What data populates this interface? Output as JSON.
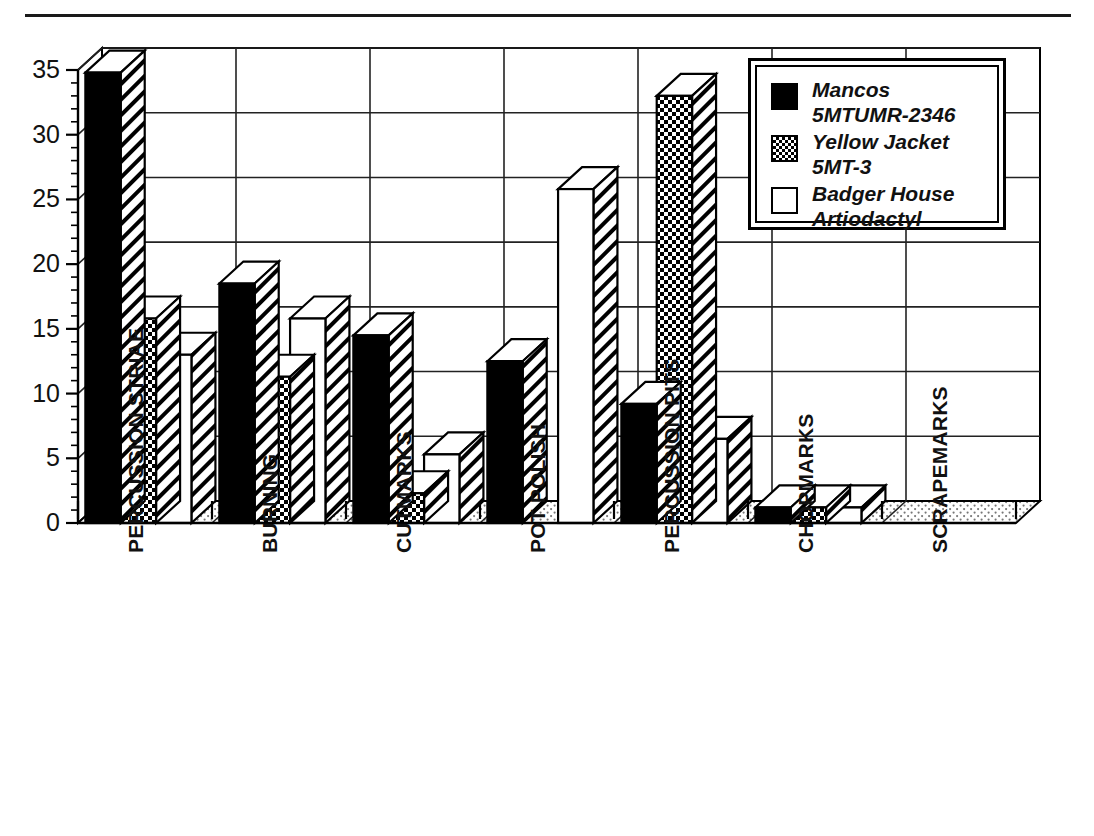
{
  "chart_data": {
    "type": "bar",
    "title": "",
    "subtitle": "",
    "xlabel": "",
    "ylabel": "",
    "ylim": [
      0,
      35
    ],
    "ytick_step": 5,
    "yticks": [
      0,
      5,
      10,
      15,
      20,
      25,
      30,
      35
    ],
    "grid": true,
    "grid_orientation": "both",
    "legend_position": "top-right",
    "style": "3d-grouped-bars",
    "categories": [
      "PERCUSSION STRIAE",
      "BURNING",
      "CUTMARKS",
      "POT POLISH",
      "PERCUSSION PITS",
      "CHOPMARKS",
      "SCRAPEMARKS"
    ],
    "series": [
      {
        "name": "Mancos 5MTUMR-2346",
        "fill": "solid-black",
        "color": "#000000",
        "values": [
          34.8,
          18.5,
          14.5,
          12.5,
          9.2,
          1.2,
          0
        ]
      },
      {
        "name": "Yellow Jacket 5MT-3",
        "fill": "dotted-checker",
        "color": "#000000",
        "values": [
          15.8,
          11.3,
          2.3,
          0,
          33.0,
          1.2,
          0
        ]
      },
      {
        "name": "Badger House Artiodactyl",
        "fill": "white",
        "color": "#ffffff",
        "values": [
          13.0,
          15.8,
          5.3,
          25.8,
          6.5,
          1.2,
          0
        ]
      }
    ]
  },
  "legend": {
    "items": [
      {
        "label": "Mancos 5MTUMR-2346",
        "swatch": "solid-black"
      },
      {
        "label": "Yellow Jacket 5MT-3",
        "swatch": "dotted-checker"
      },
      {
        "label": "Badger House Artiodactyl",
        "swatch": "white"
      }
    ]
  },
  "axis": {
    "y_tick_labels": [
      "35",
      "30",
      "25",
      "20",
      "15",
      "10",
      "5",
      "0"
    ]
  }
}
